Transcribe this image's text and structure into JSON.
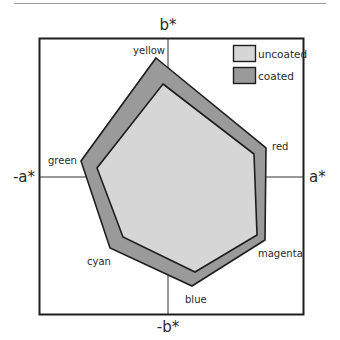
{
  "chart_data": {
    "type": "radar-gamut",
    "title": "",
    "axes": {
      "positive_x": "a*",
      "negative_x": "-a*",
      "positive_y": "b*",
      "negative_y": "-b*"
    },
    "vertex_labels": [
      "yellow",
      "red",
      "magenta",
      "blue",
      "cyan",
      "green"
    ],
    "series": [
      {
        "name": "coated",
        "fill": "#9a9a9a",
        "points": [
          [
            156,
            58
          ],
          [
            266,
            148
          ],
          [
            265,
            240
          ],
          [
            192,
            286
          ],
          [
            110,
            248
          ],
          [
            81,
            161
          ]
        ]
      },
      {
        "name": "uncoated",
        "fill": "#d6d6d6",
        "points": [
          [
            163,
            84
          ],
          [
            254,
            154
          ],
          [
            257,
            235
          ],
          [
            195,
            272
          ],
          [
            123,
            237
          ],
          [
            97,
            168
          ]
        ]
      }
    ],
    "legend": [
      {
        "label": "uncoated",
        "color": "#d6d6d6"
      },
      {
        "label": "coated",
        "color": "#9a9a9a"
      }
    ],
    "legend_position": "top-right",
    "grid": false
  },
  "labels": {
    "b_pos": "b*",
    "b_neg": "-b*",
    "a_pos": "a*",
    "a_neg": "-a*",
    "yellow": "yellow",
    "red": "red",
    "magenta": "magenta",
    "blue": "blue",
    "cyan": "cyan",
    "green": "green",
    "legend_uncoated": "uncoated",
    "legend_coated": "coated"
  }
}
